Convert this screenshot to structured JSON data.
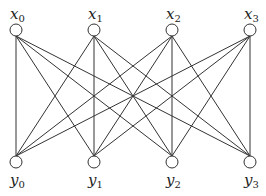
{
  "diagram": {
    "type": "complete-bipartite-graph",
    "stroke_color": "#333333",
    "node_radius": 6,
    "top_nodes": [
      {
        "id": "x0",
        "base": "x",
        "sub": "0",
        "cx": 16,
        "cy": 30
      },
      {
        "id": "x1",
        "base": "x",
        "sub": "1",
        "cx": 94,
        "cy": 30
      },
      {
        "id": "x2",
        "base": "x",
        "sub": "2",
        "cx": 172,
        "cy": 30
      },
      {
        "id": "x3",
        "base": "x",
        "sub": "3",
        "cx": 250,
        "cy": 30
      }
    ],
    "bottom_nodes": [
      {
        "id": "y0",
        "base": "y",
        "sub": "0",
        "cx": 16,
        "cy": 162
      },
      {
        "id": "y1",
        "base": "y",
        "sub": "1",
        "cx": 94,
        "cy": 162
      },
      {
        "id": "y2",
        "base": "y",
        "sub": "2",
        "cx": 172,
        "cy": 162
      },
      {
        "id": "y3",
        "base": "y",
        "sub": "3",
        "cx": 250,
        "cy": 162
      }
    ],
    "edges": [
      [
        "x0",
        "y0"
      ],
      [
        "x0",
        "y1"
      ],
      [
        "x0",
        "y2"
      ],
      [
        "x0",
        "y3"
      ],
      [
        "x1",
        "y0"
      ],
      [
        "x1",
        "y1"
      ],
      [
        "x1",
        "y2"
      ],
      [
        "x1",
        "y3"
      ],
      [
        "x2",
        "y0"
      ],
      [
        "x2",
        "y1"
      ],
      [
        "x2",
        "y2"
      ],
      [
        "x2",
        "y3"
      ],
      [
        "x3",
        "y0"
      ],
      [
        "x3",
        "y1"
      ],
      [
        "x3",
        "y2"
      ],
      [
        "x3",
        "y3"
      ]
    ]
  }
}
